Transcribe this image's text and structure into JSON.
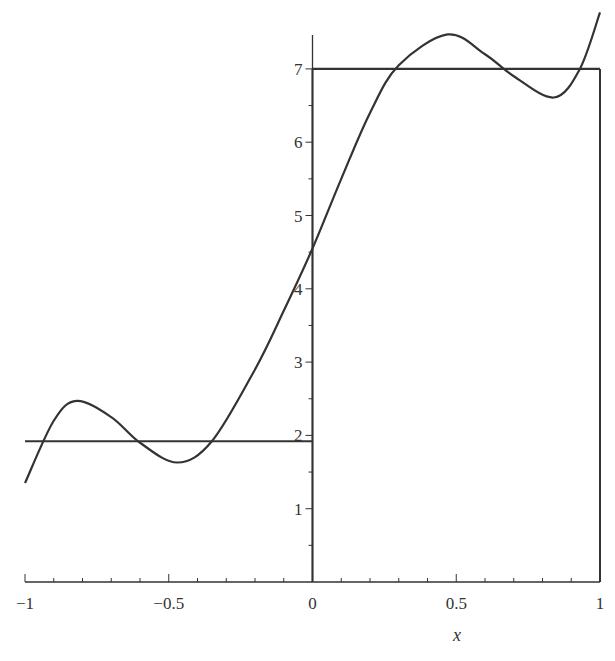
{
  "chart_data": {
    "type": "line",
    "title": "",
    "xlabel": "x",
    "ylabel": "",
    "xlim": [
      -1,
      1
    ],
    "ylim": [
      0,
      7.5
    ],
    "grid": false,
    "legend": null,
    "x_ticks": [
      -1,
      -0.5,
      0,
      0.5,
      1
    ],
    "x_tick_labels": [
      "−1",
      "−0.5",
      "0",
      "0.5",
      "1"
    ],
    "y_ticks": [
      1,
      2,
      3,
      4,
      5,
      6,
      7
    ],
    "y_tick_labels": [
      "1",
      "2",
      "3",
      "4",
      "5",
      "6",
      "7"
    ],
    "series": [
      {
        "name": "step function",
        "style": "piecewise-constant",
        "segments": [
          {
            "x": [
              -1,
              0
            ],
            "y": [
              1.92,
              1.92
            ]
          },
          {
            "x": [
              0,
              1
            ],
            "y": [
              7,
              7
            ]
          }
        ],
        "vertical_lines": [
          {
            "x": 0,
            "y": [
              0,
              7
            ]
          },
          {
            "x": 1,
            "y": [
              0,
              7
            ]
          }
        ]
      },
      {
        "name": "Fourier approximation",
        "style": "smooth",
        "x": [
          -1.0,
          -0.9,
          -0.82,
          -0.7,
          -0.6,
          -0.47,
          -0.35,
          -0.2,
          -0.1,
          0.0,
          0.1,
          0.2,
          0.3,
          0.47,
          0.6,
          0.7,
          0.84,
          0.93,
          1.0
        ],
        "y": [
          1.35,
          2.2,
          2.47,
          2.25,
          1.9,
          1.63,
          1.92,
          2.9,
          3.7,
          4.55,
          5.5,
          6.4,
          7.05,
          7.47,
          7.2,
          6.9,
          6.61,
          7.0,
          7.77
        ]
      }
    ]
  }
}
